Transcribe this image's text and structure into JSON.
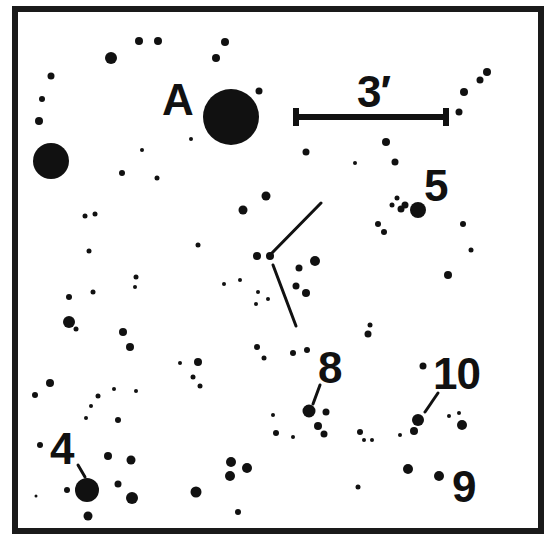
{
  "chart": {
    "ink_color": "#111111",
    "background": "#ffffff",
    "scale_bar": {
      "label": "3′",
      "x1": 296,
      "x2": 446,
      "y": 117
    },
    "labels": [
      {
        "id": "A",
        "text": "A"
      },
      {
        "id": "3",
        "text": "3′"
      },
      {
        "id": "5",
        "text": "5"
      },
      {
        "id": "8",
        "text": "8"
      },
      {
        "id": "10",
        "text": "10"
      },
      {
        "id": "4",
        "text": "4"
      },
      {
        "id": "9",
        "text": "9"
      }
    ],
    "pointer_lines": [
      {
        "from": [
          269,
          256
        ],
        "to": [
          321,
          203
        ],
        "note": "upper arm of V marker"
      },
      {
        "from": [
          273,
          265
        ],
        "to": [
          296,
          326
        ],
        "note": "lower arm of V marker"
      },
      {
        "from": [
          313,
          404
        ],
        "to": [
          320,
          385
        ],
        "note": "star 8 pointer"
      },
      {
        "from": [
          425,
          412
        ],
        "to": [
          438,
          393
        ],
        "note": "star 10 pointer"
      },
      {
        "from": [
          78,
          465
        ],
        "to": [
          85,
          477
        ],
        "note": "star 4 pointer"
      }
    ],
    "stars": [
      {
        "x": 231,
        "y": 117,
        "r": 28,
        "name": "A"
      },
      {
        "x": 51,
        "y": 161,
        "r": 18
      },
      {
        "x": 87,
        "y": 490,
        "r": 12,
        "name": "4"
      },
      {
        "x": 418,
        "y": 210,
        "r": 8,
        "name": "5"
      },
      {
        "x": 309,
        "y": 411,
        "r": 6.5,
        "name": "8"
      },
      {
        "x": 418,
        "y": 420,
        "r": 6,
        "name": "10"
      },
      {
        "x": 439,
        "y": 476,
        "r": 5,
        "name": "9"
      },
      {
        "x": 111,
        "y": 58,
        "r": 6
      },
      {
        "x": 139,
        "y": 41,
        "r": 4
      },
      {
        "x": 158,
        "y": 41,
        "r": 4
      },
      {
        "x": 225,
        "y": 42,
        "r": 4
      },
      {
        "x": 216,
        "y": 58,
        "r": 4
      },
      {
        "x": 51,
        "y": 76,
        "r": 3.5
      },
      {
        "x": 42,
        "y": 99,
        "r": 3
      },
      {
        "x": 39,
        "y": 121,
        "r": 4
      },
      {
        "x": 259,
        "y": 91,
        "r": 3.5
      },
      {
        "x": 191,
        "y": 139,
        "r": 2
      },
      {
        "x": 142,
        "y": 150,
        "r": 2
      },
      {
        "x": 122,
        "y": 173,
        "r": 3
      },
      {
        "x": 157,
        "y": 178,
        "r": 2.5
      },
      {
        "x": 243,
        "y": 210,
        "r": 4.5
      },
      {
        "x": 266,
        "y": 196,
        "r": 4.5
      },
      {
        "x": 85,
        "y": 216,
        "r": 2.5
      },
      {
        "x": 95,
        "y": 214,
        "r": 2.5
      },
      {
        "x": 89,
        "y": 251,
        "r": 2.5
      },
      {
        "x": 198,
        "y": 245,
        "r": 2.5
      },
      {
        "x": 306,
        "y": 152,
        "r": 3.5
      },
      {
        "x": 386,
        "y": 142,
        "r": 4
      },
      {
        "x": 355,
        "y": 163,
        "r": 2
      },
      {
        "x": 395,
        "y": 162,
        "r": 3.5
      },
      {
        "x": 401,
        "y": 209,
        "r": 3.5
      },
      {
        "x": 392,
        "y": 205,
        "r": 2.5
      },
      {
        "x": 397,
        "y": 198,
        "r": 2.5
      },
      {
        "x": 405,
        "y": 205,
        "r": 3.5
      },
      {
        "x": 378,
        "y": 224,
        "r": 3
      },
      {
        "x": 384,
        "y": 232,
        "r": 3
      },
      {
        "x": 463,
        "y": 224,
        "r": 3
      },
      {
        "x": 471,
        "y": 250,
        "r": 2.5
      },
      {
        "x": 448,
        "y": 275,
        "r": 4
      },
      {
        "x": 459,
        "y": 112,
        "r": 3.5
      },
      {
        "x": 464,
        "y": 92,
        "r": 4
      },
      {
        "x": 480,
        "y": 80,
        "r": 3.5
      },
      {
        "x": 487,
        "y": 72,
        "r": 4
      },
      {
        "x": 257,
        "y": 256,
        "r": 4
      },
      {
        "x": 270,
        "y": 256,
        "r": 4
      },
      {
        "x": 315,
        "y": 261,
        "r": 5
      },
      {
        "x": 299,
        "y": 268,
        "r": 3.5
      },
      {
        "x": 296,
        "y": 286,
        "r": 3.5
      },
      {
        "x": 306,
        "y": 293,
        "r": 4
      },
      {
        "x": 224,
        "y": 284,
        "r": 2
      },
      {
        "x": 240,
        "y": 280,
        "r": 2
      },
      {
        "x": 258,
        "y": 292,
        "r": 2
      },
      {
        "x": 256,
        "y": 304,
        "r": 2
      },
      {
        "x": 268,
        "y": 299,
        "r": 2
      },
      {
        "x": 69,
        "y": 322,
        "r": 6
      },
      {
        "x": 76,
        "y": 329,
        "r": 2.5
      },
      {
        "x": 69,
        "y": 297,
        "r": 3
      },
      {
        "x": 93,
        "y": 292,
        "r": 2.5
      },
      {
        "x": 136,
        "y": 277,
        "r": 2.5
      },
      {
        "x": 135,
        "y": 287,
        "r": 2
      },
      {
        "x": 123,
        "y": 332,
        "r": 4
      },
      {
        "x": 130,
        "y": 347,
        "r": 4
      },
      {
        "x": 50,
        "y": 383,
        "r": 4
      },
      {
        "x": 35,
        "y": 395,
        "r": 3
      },
      {
        "x": 98,
        "y": 396,
        "r": 2.5
      },
      {
        "x": 91,
        "y": 406,
        "r": 2
      },
      {
        "x": 86,
        "y": 418,
        "r": 2
      },
      {
        "x": 114,
        "y": 389,
        "r": 2
      },
      {
        "x": 136,
        "y": 391,
        "r": 2
      },
      {
        "x": 118,
        "y": 420,
        "r": 3
      },
      {
        "x": 40,
        "y": 445,
        "r": 3
      },
      {
        "x": 108,
        "y": 456,
        "r": 4
      },
      {
        "x": 131,
        "y": 460,
        "r": 4.5
      },
      {
        "x": 118,
        "y": 484,
        "r": 3.5
      },
      {
        "x": 132,
        "y": 498,
        "r": 6
      },
      {
        "x": 67,
        "y": 490,
        "r": 3
      },
      {
        "x": 36,
        "y": 496,
        "r": 1.5
      },
      {
        "x": 88,
        "y": 516,
        "r": 4.5
      },
      {
        "x": 180,
        "y": 363,
        "r": 2
      },
      {
        "x": 198,
        "y": 362,
        "r": 4
      },
      {
        "x": 193,
        "y": 377,
        "r": 2.5
      },
      {
        "x": 200,
        "y": 386,
        "r": 2.5
      },
      {
        "x": 257,
        "y": 347,
        "r": 3
      },
      {
        "x": 264,
        "y": 358,
        "r": 2.5
      },
      {
        "x": 293,
        "y": 353,
        "r": 3
      },
      {
        "x": 307,
        "y": 350,
        "r": 3
      },
      {
        "x": 370,
        "y": 325,
        "r": 2.5
      },
      {
        "x": 368,
        "y": 334,
        "r": 3.5
      },
      {
        "x": 326,
        "y": 412,
        "r": 3.5
      },
      {
        "x": 318,
        "y": 426,
        "r": 4
      },
      {
        "x": 324,
        "y": 434,
        "r": 3.5
      },
      {
        "x": 273,
        "y": 415,
        "r": 2
      },
      {
        "x": 276,
        "y": 433,
        "r": 3
      },
      {
        "x": 293,
        "y": 437,
        "r": 2
      },
      {
        "x": 360,
        "y": 432,
        "r": 3
      },
      {
        "x": 364,
        "y": 440,
        "r": 2
      },
      {
        "x": 372,
        "y": 440,
        "r": 2
      },
      {
        "x": 400,
        "y": 435,
        "r": 2
      },
      {
        "x": 414,
        "y": 431,
        "r": 4
      },
      {
        "x": 423,
        "y": 366,
        "r": 3.5
      },
      {
        "x": 449,
        "y": 416,
        "r": 2
      },
      {
        "x": 459,
        "y": 413,
        "r": 2
      },
      {
        "x": 462,
        "y": 425,
        "r": 5
      },
      {
        "x": 408,
        "y": 469,
        "r": 5
      },
      {
        "x": 231,
        "y": 462,
        "r": 5
      },
      {
        "x": 247,
        "y": 468,
        "r": 5
      },
      {
        "x": 230,
        "y": 476,
        "r": 5
      },
      {
        "x": 196,
        "y": 492,
        "r": 5.5
      },
      {
        "x": 238,
        "y": 512,
        "r": 3
      },
      {
        "x": 358,
        "y": 487,
        "r": 2.5
      }
    ]
  }
}
